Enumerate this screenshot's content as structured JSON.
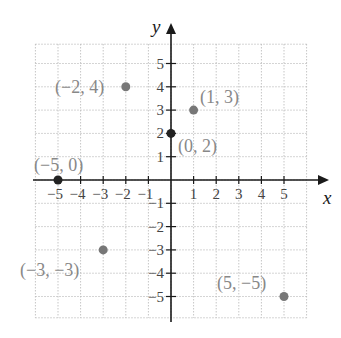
{
  "chart_data": {
    "type": "scatter",
    "title": "",
    "xlabel": "x",
    "ylabel": "y",
    "xlim": [
      -6,
      6
    ],
    "ylim": [
      -6,
      6
    ],
    "grid": true,
    "legend": null,
    "x_ticks": [
      -5,
      -4,
      -3,
      -2,
      -1,
      1,
      2,
      3,
      4,
      5
    ],
    "x_tick_labels": [
      "−5",
      "−4",
      "−3",
      "−2",
      "−1",
      "1",
      "2",
      "3",
      "4",
      "5"
    ],
    "y_ticks": [
      5,
      4,
      3,
      2,
      1,
      -1,
      -2,
      -3,
      -4,
      -5
    ],
    "y_tick_labels": [
      "5",
      "4",
      "3",
      "2",
      "1",
      "−1",
      "−2",
      "−3",
      "−4",
      "−5"
    ],
    "points": [
      {
        "x": -2,
        "y": 4,
        "label": "(−2, 4)",
        "color": "#777777"
      },
      {
        "x": 1,
        "y": 3,
        "label": "(1, 3)",
        "color": "#777777"
      },
      {
        "x": 0,
        "y": 2,
        "label": "(0, 2)",
        "color": "#222222"
      },
      {
        "x": -5,
        "y": 0,
        "label": "(−5, 0)",
        "color": "#222222"
      },
      {
        "x": -3,
        "y": -3,
        "label": "(−3, −3)",
        "color": "#777777"
      },
      {
        "x": 5,
        "y": -5,
        "label": "(5, −5)",
        "color": "#777777"
      }
    ]
  },
  "colors": {
    "axis": "#1a1a1a",
    "grid": "#b8b8b8",
    "tick_label": "#444444",
    "point_label": "#888888"
  },
  "axis_labels": {
    "x": "x",
    "y": "y"
  }
}
